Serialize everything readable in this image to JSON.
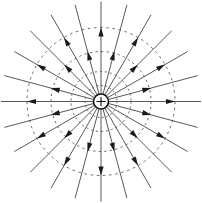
{
  "figure": {
    "background_color": "#ffffff",
    "width": 202,
    "height": 203,
    "center": {
      "x": 101,
      "y": 101.5
    }
  },
  "charge": {
    "label": "+",
    "type": "positive-point-charge",
    "ring_radius": 7.5,
    "ring_color": "#111111",
    "sign_color": "#111111",
    "sign_arm_length": 4.6
  },
  "field_lines": {
    "count": 24,
    "angle_step_deg": 15,
    "start_angle_deg": -90,
    "inner_radius": 7.5,
    "outer_radius": 100,
    "color": "#3a3a3a",
    "stroke_width": 0.85,
    "direction": "outward",
    "arrow": {
      "color": "#1a1a1a",
      "length": 9,
      "half_width": 2.6,
      "radius_long": 74,
      "radius_short": 52,
      "alternating": true
    },
    "angles_deg": [
      -90,
      -75,
      -60,
      -45,
      -30,
      -15,
      0,
      15,
      30,
      45,
      60,
      75,
      90,
      105,
      120,
      135,
      150,
      165,
      180,
      195,
      210,
      225,
      240,
      255
    ]
  },
  "equipotentials": {
    "count": 4,
    "color": "#444444",
    "stroke_width": 0.8,
    "style": "dashed",
    "radii": [
      16,
      30,
      50,
      74
    ],
    "dash_patterns": [
      "2,2.4",
      "2.2,2.8",
      "2.4,3.2",
      "2.6,3.6"
    ]
  },
  "legend": {
    "field_line_name": "electric-field-line",
    "equipotential_name": "equipotential-circle",
    "charge_name": "positive-charge-symbol"
  }
}
